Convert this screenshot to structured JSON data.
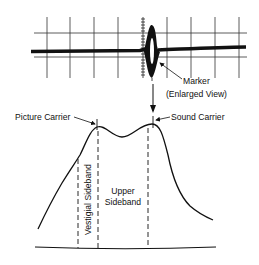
{
  "oscilloscope": {
    "grid_vertical_x": [
      47,
      70,
      94,
      118,
      143,
      167,
      191,
      215,
      239
    ],
    "grid_horizontal_y": [
      33,
      57
    ],
    "grid_x_range": [
      34,
      247
    ],
    "grid_y_range": [
      17,
      78
    ],
    "center_tick_x": 143,
    "trace_y": 51,
    "marker_x": 152
  },
  "labels": {
    "marker": "Marker",
    "marker_sub": "(Enlarged View)",
    "picture_carrier": "Picture Carrier",
    "sound_carrier": "Sound Carrier",
    "vestigial_sideband": "Vestigial Sideband",
    "upper_sideband_line1": "Upper",
    "upper_sideband_line2": "Sideband"
  },
  "response_curve": {
    "picture_carrier_x": 97,
    "sound_carrier_x": 153,
    "dashed_lines_x": [
      78,
      98,
      148
    ],
    "baseline_y": 248
  },
  "colors": {
    "ink": "#111111",
    "grid": "#333333",
    "background": "#ffffff"
  }
}
